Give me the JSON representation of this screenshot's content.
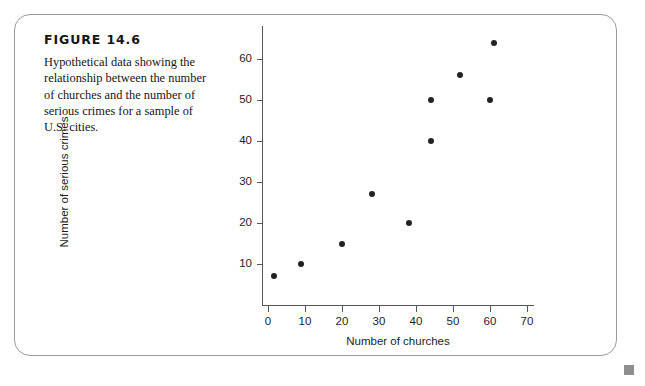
{
  "figure": {
    "label": "FIGURE 14.6",
    "caption": "Hypothetical data showing the relationship between the number of churches and the number of serious crimes for a sample of U.S. cities."
  },
  "chart_data": {
    "type": "scatter",
    "title": "",
    "xlabel": "Number of churches",
    "ylabel": "Number of serious crimes",
    "xlim": [
      0,
      72
    ],
    "ylim": [
      0,
      68
    ],
    "xticks": [
      0,
      10,
      20,
      30,
      40,
      50,
      60,
      70
    ],
    "yticks": [
      10,
      20,
      30,
      40,
      50,
      60
    ],
    "grid": false,
    "legend": null,
    "series": [
      {
        "name": "U.S. cities",
        "x": [
          1.5,
          9,
          20,
          28,
          38,
          44,
          44,
          52,
          60,
          61
        ],
        "y": [
          7,
          10,
          15,
          27,
          20,
          40,
          50,
          56,
          50,
          64
        ],
        "marker_color": "#232323"
      }
    ]
  },
  "page": {
    "background_color": "#ffffff",
    "frame_color": "#9a9a9a",
    "marker_color": "#8f8f8f"
  }
}
